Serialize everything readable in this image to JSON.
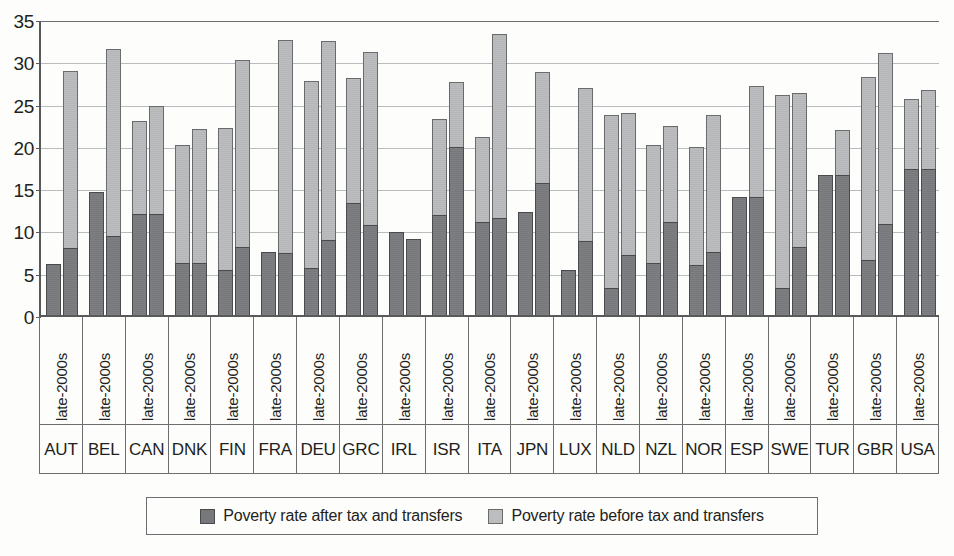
{
  "chart_data": {
    "type": "bar",
    "subtype": "grouped-stacked",
    "title": "",
    "xlabel": "",
    "ylabel": "",
    "ylim": [
      0,
      35
    ],
    "ytick_step": 5,
    "ytick_labels": [
      "0",
      "5",
      "10",
      "15",
      "20",
      "25",
      "30",
      "35"
    ],
    "grid": true,
    "legend_position": "bottom",
    "period_label": "late-2000s",
    "categories": [
      "AUT",
      "BEL",
      "CAN",
      "DNK",
      "FIN",
      "FRA",
      "DEU",
      "GRC",
      "IRL",
      "ISR",
      "ITA",
      "JPN",
      "LUX",
      "NLD",
      "NZL",
      "NOR",
      "ESP",
      "SWE",
      "TUR",
      "GBR",
      "USA"
    ],
    "series": [
      {
        "name": "Poverty rate after tax and transfers",
        "color": "#77787b",
        "bar1_values": [
          6.0,
          14.6,
          12.0,
          6.1,
          5.3,
          7.5,
          5.6,
          13.3,
          9.8,
          11.8,
          11.0,
          12.2,
          5.3,
          3.2,
          6.2,
          5.9,
          14.0,
          3.2,
          16.5,
          6.5,
          17.3
        ],
        "bar2_values": [
          7.9,
          9.4,
          12.0,
          6.1,
          8.0,
          7.3,
          8.9,
          10.7,
          9.0,
          19.9,
          11.5,
          15.6,
          8.7,
          7.1,
          11.0,
          7.5,
          14.0,
          8.0,
          16.5,
          10.8,
          17.3
        ]
      },
      {
        "name": "Poverty rate before tax and transfers",
        "color": "#bcbdbf",
        "bar1_values": [
          6.0,
          14.6,
          23.0,
          20.1,
          22.1,
          7.5,
          27.7,
          28.0,
          9.8,
          23.2,
          21.1,
          12.2,
          5.3,
          23.7,
          20.1,
          19.9,
          14.0,
          26.0,
          16.5,
          28.1,
          25.5
        ],
        "bar2_values": [
          28.8,
          31.4,
          24.7,
          22.0,
          30.1,
          32.5,
          32.4,
          31.1,
          9.0,
          27.6,
          33.2,
          28.7,
          26.9,
          23.9,
          22.3,
          23.7,
          27.1,
          26.3,
          21.9,
          31.0,
          26.6
        ]
      }
    ]
  },
  "legend": {
    "entries": [
      {
        "label": "Poverty rate after tax and transfers",
        "swatch": "dark"
      },
      {
        "label": "Poverty rate before tax and transfers",
        "swatch": "light"
      }
    ]
  }
}
